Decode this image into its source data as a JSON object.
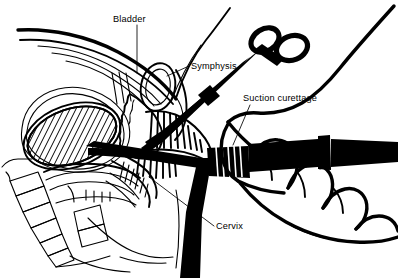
{
  "figure": {
    "style": "black-and-white line art",
    "background_color": "#ffffff",
    "line_color": "#000000",
    "width": 398,
    "height": 278
  },
  "labels": [
    {
      "id": "bladder",
      "text": "Bladder",
      "text_x": 113,
      "text_y": 22,
      "leader": "M 137 25 L 137 73",
      "anchor": "start"
    },
    {
      "id": "symphysis",
      "text": "Symphysis",
      "text_x": 191,
      "text_y": 69,
      "leader": "M 189 66 L 167 76",
      "anchor": "start"
    },
    {
      "id": "suction-curettage",
      "text": "Suction curettage",
      "text_x": 243,
      "text_y": 101,
      "leader": "M 250 105 L 233 145",
      "anchor": "start"
    },
    {
      "id": "cervix",
      "text": "Cervix",
      "text_x": 216,
      "text_y": 229,
      "leader": "M 214 226 L 149 177",
      "anchor": "start"
    }
  ],
  "structures": [
    {
      "id": "abdominal-wall",
      "name": "Abdominal wall"
    },
    {
      "id": "symphysis-pubis",
      "name": "Symphysis pubis"
    },
    {
      "id": "bladder",
      "name": "Bladder"
    },
    {
      "id": "uterus",
      "name": "Gravid uterus (hatched)"
    },
    {
      "id": "cervix",
      "name": "Cervix"
    },
    {
      "id": "vagina",
      "name": "Vagina with rugae"
    },
    {
      "id": "rectum",
      "name": "Rectum"
    },
    {
      "id": "sacrum",
      "name": "Sacrum and coccyx"
    },
    {
      "id": "cannula",
      "name": "Suction cannula and tubing"
    },
    {
      "id": "tenaculum",
      "name": "Tenaculum forceps"
    },
    {
      "id": "hand",
      "name": "Operator hand and forearm"
    }
  ]
}
